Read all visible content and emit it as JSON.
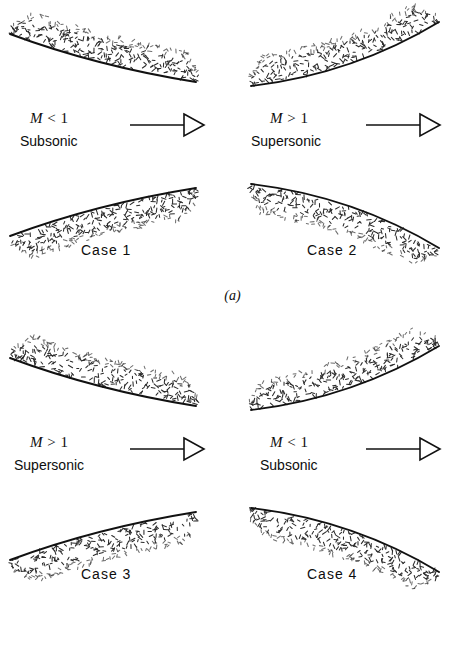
{
  "figure": {
    "panels": [
      {
        "letter": "(a)",
        "cases": [
          {
            "case_label": "Case 1",
            "mach_symbol": "M",
            "mach_relation": "< 1",
            "regime": "Subsonic",
            "duct_shape": "converging",
            "arrow": "flow-direction-right"
          },
          {
            "case_label": "Case 2",
            "mach_symbol": "M",
            "mach_relation": "> 1",
            "regime": "Supersonic",
            "duct_shape": "diverging",
            "arrow": "flow-direction-right"
          }
        ]
      },
      {
        "letter": "(b)",
        "cases": [
          {
            "case_label": "Case 3",
            "mach_symbol": "M",
            "mach_relation": "> 1",
            "regime": "Supersonic",
            "duct_shape": "converging",
            "arrow": "flow-direction-right"
          },
          {
            "case_label": "Case 4",
            "mach_symbol": "M",
            "mach_relation": "< 1",
            "regime": "Subsonic",
            "duct_shape": "diverging",
            "arrow": "flow-direction-right"
          }
        ]
      }
    ],
    "colors": {
      "background": "#ffffff",
      "wall_line": "#111111",
      "hatch": "#2b2b2b",
      "text": "#0d0d0d"
    }
  }
}
